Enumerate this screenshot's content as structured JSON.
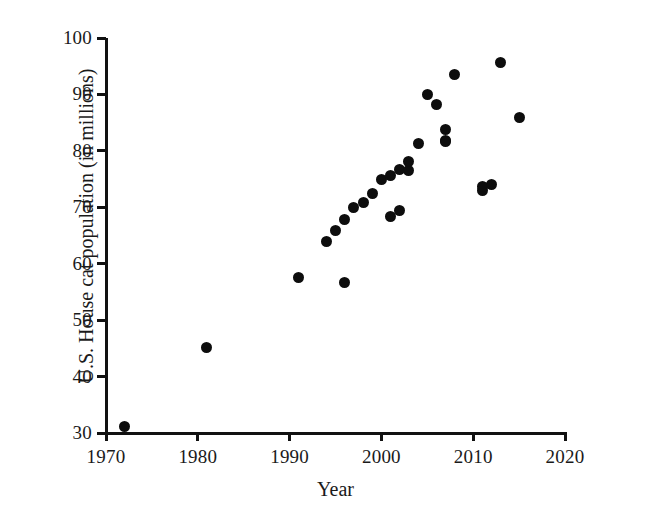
{
  "chart_data": {
    "type": "scatter",
    "title": "",
    "xlabel": "Year",
    "ylabel": "U.S. House cat population (in millions)",
    "xlim": [
      1970,
      2020
    ],
    "ylim": [
      30,
      100
    ],
    "xticks": [
      1970,
      1980,
      1990,
      2000,
      2010,
      2020
    ],
    "yticks": [
      30,
      40,
      50,
      60,
      70,
      80,
      90,
      100
    ],
    "grid": false,
    "legend": "none",
    "marker": {
      "shape": "circle",
      "color": "#0d0d0d",
      "size_px": 11
    },
    "axis_color": "#111111",
    "background_color": "#ffffff",
    "series": [
      {
        "name": "U.S. house cat population",
        "x": [
          1972,
          1981,
          1991,
          1994,
          1995,
          1996,
          1996,
          1997,
          1998,
          1999,
          2000,
          2001,
          2001,
          2002,
          2002,
          2003,
          2003,
          2004,
          2005,
          2006,
          2007,
          2007,
          2007,
          2008,
          2011,
          2011,
          2012,
          2013,
          2015
        ],
        "y": [
          31.2,
          45.1,
          57.5,
          63.9,
          65.8,
          56.6,
          67.8,
          69.9,
          70.8,
          72.4,
          74.9,
          68.4,
          75.6,
          69.5,
          76.7,
          76.6,
          78.2,
          81.3,
          89.9,
          88.2,
          81.8,
          83.8,
          81.6,
          93.5,
          72.9,
          73.6,
          74.1,
          95.6,
          85.9
        ]
      }
    ]
  },
  "axes": {
    "x_tick_labels": [
      "1970",
      "1980",
      "1990",
      "2000",
      "2010",
      "2020"
    ],
    "y_tick_labels": [
      "30",
      "40",
      "50",
      "60",
      "70",
      "80",
      "90",
      "100"
    ],
    "x_title": "Year",
    "y_title": "U.S. House cat population (in millions)"
  }
}
